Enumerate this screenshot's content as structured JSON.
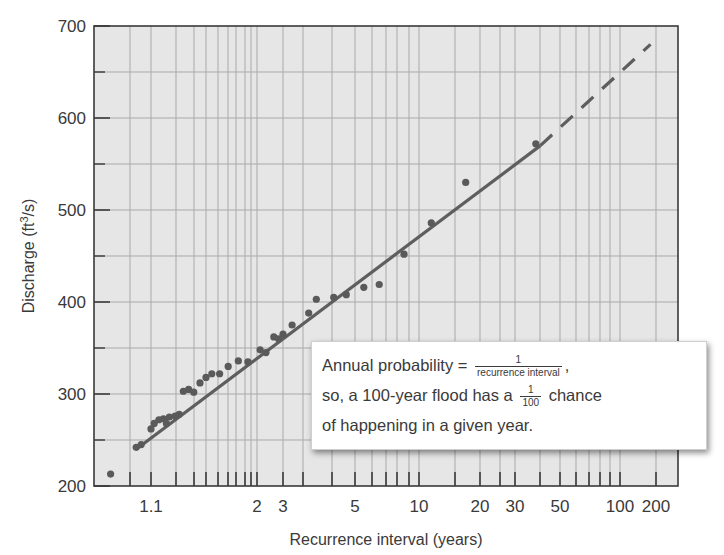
{
  "chart_data": {
    "type": "scatter",
    "title": "",
    "xlabel": "Recurrence interval (years)",
    "ylabel": "Discharge (ft³/s)",
    "ylabel_parts": {
      "pre": "Discharge (ft",
      "sup": "3",
      "post": "/s)"
    },
    "xscale": "probability (log-like)",
    "xlim": [
      1.0,
      200
    ],
    "ylim": [
      200,
      700
    ],
    "grid": true,
    "y_ticks": [
      200,
      300,
      400,
      500,
      600,
      700
    ],
    "y_minor_ticks": [
      250,
      350,
      450,
      550,
      650
    ],
    "x_tick_labels": [
      "1.1",
      "2",
      "3",
      "5",
      "10",
      "20",
      "30",
      "50",
      "100",
      "200"
    ],
    "x_tick_label_px": [
      151,
      257,
      283,
      355,
      419,
      480,
      515,
      560,
      620,
      656
    ],
    "x_gridline_px": [
      130,
      151,
      176,
      194,
      206,
      218,
      228,
      236,
      245,
      251,
      257,
      283,
      303,
      332,
      355,
      372,
      386,
      397,
      409,
      419,
      455,
      480,
      500,
      515,
      540,
      560,
      576,
      589,
      600,
      610,
      620,
      656
    ],
    "series": [
      {
        "name": "Annual peak discharge",
        "kind": "points",
        "points": [
          {
            "x": 1.02,
            "y": 213
          },
          {
            "x": 1.07,
            "y": 242
          },
          {
            "x": 1.08,
            "y": 245
          },
          {
            "x": 1.1,
            "y": 262
          },
          {
            "x": 1.12,
            "y": 268
          },
          {
            "x": 1.15,
            "y": 272
          },
          {
            "x": 1.18,
            "y": 273
          },
          {
            "x": 1.2,
            "y": 268
          },
          {
            "x": 1.22,
            "y": 275
          },
          {
            "x": 1.26,
            "y": 276
          },
          {
            "x": 1.29,
            "y": 278
          },
          {
            "x": 1.32,
            "y": 303
          },
          {
            "x": 1.36,
            "y": 305
          },
          {
            "x": 1.4,
            "y": 302
          },
          {
            "x": 1.45,
            "y": 312
          },
          {
            "x": 1.5,
            "y": 318
          },
          {
            "x": 1.55,
            "y": 322
          },
          {
            "x": 1.62,
            "y": 322
          },
          {
            "x": 1.7,
            "y": 330
          },
          {
            "x": 1.8,
            "y": 336
          },
          {
            "x": 1.9,
            "y": 335
          },
          {
            "x": 2.1,
            "y": 348
          },
          {
            "x": 2.3,
            "y": 345
          },
          {
            "x": 2.6,
            "y": 362
          },
          {
            "x": 2.8,
            "y": 360
          },
          {
            "x": 3.0,
            "y": 365
          },
          {
            "x": 3.2,
            "y": 375
          },
          {
            "x": 3.6,
            "y": 388
          },
          {
            "x": 3.8,
            "y": 403
          },
          {
            "x": 4.3,
            "y": 405
          },
          {
            "x": 4.7,
            "y": 408
          },
          {
            "x": 5.5,
            "y": 416
          },
          {
            "x": 6.5,
            "y": 419
          },
          {
            "x": 8.5,
            "y": 452
          },
          {
            "x": 11.5,
            "y": 486
          },
          {
            "x": 17,
            "y": 530
          },
          {
            "x": 38,
            "y": 572
          }
        ]
      },
      {
        "name": "Best-fit line",
        "kind": "line-solid",
        "points": [
          {
            "x": 1.07,
            "y": 240
          },
          {
            "x": 40,
            "y": 570
          }
        ]
      },
      {
        "name": "Extrapolation",
        "kind": "line-dashed",
        "points": [
          {
            "x": 40,
            "y": 570
          },
          {
            "x": 180,
            "y": 680
          }
        ]
      }
    ],
    "annotation": {
      "line1_pre": "Annual probability = ",
      "line1_frac_num": "1",
      "line1_frac_den": "recurrence interval",
      "line1_post": ",",
      "line2_pre": "so, a 100-year flood has a ",
      "line2_frac_num": "1",
      "line2_frac_den": "100",
      "line2_post": " chance",
      "line3": "of happening in a given year."
    },
    "colors": {
      "plot_bg": "#e6e6e6",
      "grid": "#a9a9a9",
      "frame": "#3a3a3a",
      "line": "#5e5e5e",
      "points": "#5a5a5a",
      "text": "#3a3a3a"
    }
  }
}
